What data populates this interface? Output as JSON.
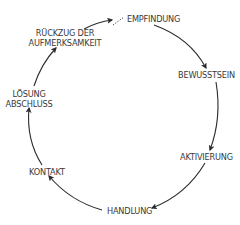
{
  "diagram": {
    "type": "cycle",
    "colors": {
      "line": "#2b2b2b",
      "text": "#3a3a3a",
      "background": "#ffffff"
    },
    "stages": [
      {
        "id": "empfindung",
        "label": "EMPFINDUNG"
      },
      {
        "id": "bewusstsein",
        "label": "BEWUSSTSEIN"
      },
      {
        "id": "aktivierung",
        "label": "AKTIVIERUNG"
      },
      {
        "id": "handlung",
        "label": "HANDLUNG"
      },
      {
        "id": "kontakt",
        "label": "KONTAKT"
      },
      {
        "id": "loesung",
        "lines": [
          "LÖSUNG",
          "ABSCHLUSS"
        ]
      },
      {
        "id": "rueckzug",
        "lines": [
          "RÜCKZUG DER",
          "AUFMERKSAMKEIT"
        ]
      }
    ],
    "edges": [
      {
        "from": "empfindung",
        "to": "bewusstsein",
        "style": "solid-arrow"
      },
      {
        "from": "bewusstsein",
        "to": "aktivierung",
        "style": "solid-arrow"
      },
      {
        "from": "aktivierung",
        "to": "handlung",
        "style": "solid-arrow"
      },
      {
        "from": "handlung",
        "to": "kontakt",
        "style": "solid-arrow"
      },
      {
        "from": "kontakt",
        "to": "loesung",
        "style": "solid-arrow"
      },
      {
        "from": "loesung",
        "to": "rueckzug",
        "style": "solid-arrow"
      },
      {
        "from": "rueckzug",
        "to": "empfindung",
        "style": "solid-arrow-then-dotted"
      }
    ]
  }
}
